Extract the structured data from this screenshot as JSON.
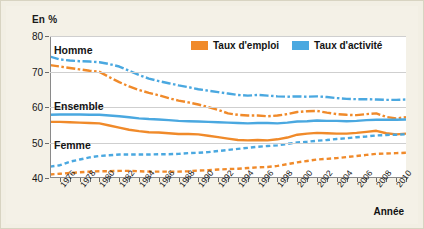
{
  "axis": {
    "y_title": "En %",
    "x_title": "Année",
    "y_ticks": [
      "80",
      "70",
      "60",
      "50",
      "40"
    ],
    "x_ticks": [
      "1976",
      "1978",
      "1980",
      "1982",
      "1984",
      "1986",
      "1988",
      "1990",
      "1992",
      "1994",
      "1996",
      "1998",
      "2000",
      "2002",
      "2004",
      "2006",
      "2008",
      "2010"
    ]
  },
  "legend": {
    "items": [
      {
        "label": "Taux d'emploi",
        "color": "#f08a2a",
        "icon": "legend-swatch"
      },
      {
        "label": "Taux d'activité",
        "color": "#4aa8e0",
        "icon": "legend-swatch"
      }
    ]
  },
  "annotations": [
    {
      "label": "Homme"
    },
    {
      "label": "Ensemble"
    },
    {
      "label": "Femme"
    }
  ],
  "colors": {
    "emploi": "#f08a2a",
    "activite": "#4aa8e0",
    "grid": "#cfcfcf",
    "axis": "#8a8a8a",
    "page_bg": "#f4f1e7",
    "plot_bg": "#ffffff"
  },
  "chart_data": {
    "type": "line",
    "title": "",
    "subtitle": "",
    "xlabel": "Année",
    "ylabel": "En %",
    "ylim": [
      40,
      80
    ],
    "xlim": [
      1975,
      2011
    ],
    "grid": true,
    "legend_position": "top-right-inside",
    "x": [
      1975,
      1976,
      1977,
      1978,
      1979,
      1980,
      1981,
      1982,
      1983,
      1984,
      1985,
      1986,
      1987,
      1988,
      1989,
      1990,
      1991,
      1992,
      1993,
      1994,
      1995,
      1996,
      1997,
      1998,
      1999,
      2000,
      2001,
      2002,
      2003,
      2004,
      2005,
      2006,
      2007,
      2008,
      2009,
      2010,
      2011
    ],
    "series": [
      {
        "name": "Taux d'activité - Homme",
        "group": "Homme",
        "measure": "Taux d'activité",
        "color": "#4aa8e0",
        "style": "dashdot",
        "values": [
          74.2,
          73.4,
          73.1,
          72.9,
          72.8,
          72.6,
          72.1,
          71.4,
          70.2,
          69.0,
          68.0,
          67.3,
          66.7,
          66.1,
          65.6,
          65.0,
          64.6,
          64.2,
          63.8,
          63.4,
          63.2,
          63.4,
          63.2,
          63.0,
          62.9,
          63.0,
          62.9,
          63.0,
          62.8,
          62.5,
          62.3,
          62.2,
          62.2,
          62.1,
          62.0,
          62.0,
          62.1
        ]
      },
      {
        "name": "Taux d'emploi - Homme",
        "group": "Homme",
        "measure": "Taux d'emploi",
        "color": "#f08a2a",
        "style": "dashdot",
        "values": [
          71.8,
          71.4,
          71.0,
          70.6,
          70.2,
          69.9,
          68.4,
          67.0,
          65.8,
          64.8,
          64.0,
          63.3,
          62.5,
          61.8,
          61.3,
          60.7,
          60.0,
          59.2,
          58.2,
          57.8,
          57.6,
          57.6,
          57.4,
          57.6,
          58.0,
          58.6,
          58.8,
          58.9,
          58.4,
          58.0,
          57.8,
          57.7,
          58.0,
          58.2,
          57.2,
          56.8,
          57.1
        ]
      },
      {
        "name": "Taux d'activité - Ensemble",
        "group": "Ensemble",
        "measure": "Taux d'activité",
        "color": "#4aa8e0",
        "style": "solid",
        "values": [
          57.8,
          57.9,
          57.9,
          57.9,
          57.8,
          57.8,
          57.6,
          57.4,
          57.1,
          56.8,
          56.6,
          56.5,
          56.3,
          56.1,
          56.0,
          55.9,
          55.8,
          55.7,
          55.6,
          55.5,
          55.4,
          55.5,
          55.5,
          55.4,
          55.6,
          55.9,
          56.0,
          56.2,
          56.1,
          56.1,
          56.0,
          56.1,
          56.3,
          56.4,
          56.4,
          56.4,
          56.5
        ]
      },
      {
        "name": "Taux d'emploi - Ensemble",
        "group": "Ensemble",
        "measure": "Taux d'emploi",
        "color": "#f08a2a",
        "style": "solid",
        "values": [
          55.8,
          55.8,
          55.7,
          55.6,
          55.5,
          55.4,
          54.8,
          54.2,
          53.6,
          53.2,
          52.9,
          52.8,
          52.6,
          52.4,
          52.4,
          52.3,
          51.9,
          51.5,
          51.1,
          50.7,
          50.6,
          50.7,
          50.6,
          50.9,
          51.4,
          52.2,
          52.5,
          52.7,
          52.6,
          52.5,
          52.5,
          52.7,
          53.0,
          53.3,
          52.6,
          52.3,
          52.5
        ]
      },
      {
        "name": "Taux d'activité - Femme",
        "group": "Femme",
        "measure": "Taux d'activité",
        "color": "#4aa8e0",
        "style": "dashed",
        "values": [
          43.2,
          43.6,
          44.6,
          45.2,
          45.8,
          46.2,
          46.4,
          46.6,
          46.6,
          46.6,
          46.6,
          46.7,
          46.7,
          46.8,
          47.0,
          47.1,
          47.3,
          47.6,
          47.9,
          48.2,
          48.5,
          48.8,
          49.0,
          49.2,
          49.6,
          50.0,
          50.2,
          50.5,
          50.7,
          51.0,
          51.2,
          51.5,
          51.7,
          52.0,
          52.1,
          52.2,
          52.3
        ]
      },
      {
        "name": "Taux d'emploi - Femme",
        "group": "Femme",
        "measure": "Taux d'emploi",
        "color": "#f08a2a",
        "style": "dashed",
        "values": [
          41.0,
          41.2,
          41.4,
          41.6,
          41.8,
          41.9,
          41.9,
          42.0,
          42.0,
          41.9,
          41.8,
          41.8,
          41.8,
          41.8,
          41.9,
          42.1,
          42.2,
          42.4,
          42.5,
          42.6,
          42.8,
          43.0,
          43.1,
          43.4,
          43.9,
          44.4,
          44.8,
          45.2,
          45.4,
          45.6,
          45.9,
          46.2,
          46.5,
          46.8,
          46.9,
          47.0,
          47.1
        ]
      }
    ]
  }
}
